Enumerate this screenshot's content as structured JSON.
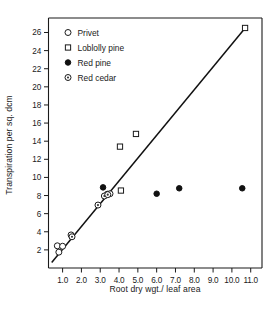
{
  "chart_data": {
    "type": "scatter",
    "title": "",
    "xlabel": "Root dry wgt./ leaf area",
    "ylabel": "Transpiration per sq. dcm",
    "xlim": [
      0.25,
      11.6
    ],
    "ylim": [
      0.0,
      27.6
    ],
    "xticks": [
      1.0,
      2.0,
      3.0,
      4.0,
      5.0,
      6.0,
      7.0,
      8.0,
      9.0,
      10.0,
      11.0
    ],
    "xticklabels": [
      "1.0",
      "2.0",
      "3.0",
      "4.0",
      "5.0",
      "6.0",
      "7.0",
      "8.0",
      "9.0",
      "10.0",
      "11.0"
    ],
    "yticks": [
      2,
      4,
      6,
      8,
      10,
      12,
      14,
      16,
      18,
      20,
      22,
      24,
      26
    ],
    "yticklabels": [
      "2",
      "4",
      "6",
      "8",
      "10",
      "12",
      "14",
      "16",
      "18",
      "20",
      "22",
      "24",
      "26"
    ],
    "grid": false,
    "legend_position": "upper-left",
    "series": [
      {
        "name": "Privet",
        "marker": "open-circle",
        "points": [
          {
            "x": 0.72,
            "y": 2.45
          },
          {
            "x": 0.8,
            "y": 1.75
          },
          {
            "x": 1.0,
            "y": 2.4
          },
          {
            "x": 1.45,
            "y": 3.65
          },
          {
            "x": 3.38,
            "y": 8.15
          },
          {
            "x": 3.52,
            "y": 8.2
          }
        ]
      },
      {
        "name": "Loblolly pine",
        "marker": "open-square",
        "points": [
          {
            "x": 4.05,
            "y": 13.4
          },
          {
            "x": 4.9,
            "y": 14.8
          },
          {
            "x": 4.1,
            "y": 8.55
          },
          {
            "x": 10.7,
            "y": 26.5
          }
        ]
      },
      {
        "name": "Red pine",
        "marker": "filled-circle",
        "points": [
          {
            "x": 3.15,
            "y": 8.9
          },
          {
            "x": 6.0,
            "y": 8.2
          },
          {
            "x": 7.2,
            "y": 8.8
          },
          {
            "x": 10.55,
            "y": 8.8
          }
        ]
      },
      {
        "name": "Red cedar",
        "marker": "dotted-circle",
        "points": [
          {
            "x": 1.5,
            "y": 3.45
          },
          {
            "x": 2.88,
            "y": 6.95
          },
          {
            "x": 3.22,
            "y": 7.95
          },
          {
            "x": 3.4,
            "y": 8.1
          }
        ]
      }
    ],
    "fit_line": {
      "name": "regression-line",
      "x_start": 0.42,
      "y_start": 0.6,
      "x_end": 10.75,
      "y_end": 26.6
    },
    "legend": [
      {
        "label": "Privet",
        "marker": "open-circle"
      },
      {
        "label": "Loblolly pine",
        "marker": "open-square"
      },
      {
        "label": "Red pine",
        "marker": "filled-circle"
      },
      {
        "label": "Red cedar",
        "marker": "dotted-circle"
      }
    ],
    "colors": {
      "ink": "#1a1a1a",
      "line": "#111111",
      "background": "#ffffff"
    }
  }
}
